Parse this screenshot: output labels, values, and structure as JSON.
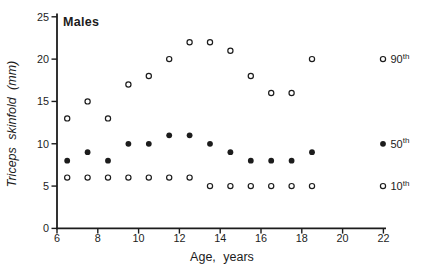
{
  "title": "Males",
  "colors": {
    "ink": "#1c1c1c",
    "background": "#ffffff"
  },
  "axes": {
    "x": {
      "label": "Age, years",
      "ticks": [
        6,
        8,
        10,
        12,
        14,
        16,
        18,
        20,
        22
      ]
    },
    "y": {
      "label": "Triceps skinfold (mm)",
      "ticks": [
        0,
        5,
        10,
        15,
        20,
        25
      ]
    }
  },
  "legend": [
    {
      "base": "90",
      "sup": "th",
      "marker": "open-circle",
      "at_value": 20
    },
    {
      "base": "50",
      "sup": "th",
      "marker": "filled-circle",
      "at_value": 10
    },
    {
      "base": "10",
      "sup": "th",
      "marker": "open-circle",
      "at_value": 5
    }
  ],
  "chart_data": {
    "type": "scatter",
    "title": "Males",
    "xlabel": "Age, years",
    "ylabel": "Triceps skinfold (mm)",
    "xlim": [
      6,
      22
    ],
    "ylim": [
      0,
      25
    ],
    "grid": false,
    "legend_position": "right",
    "x": [
      6.5,
      7.5,
      8.5,
      9.5,
      10.5,
      11.5,
      12.5,
      13.5,
      14.5,
      15.5,
      16.5,
      17.5,
      18.5
    ],
    "series": [
      {
        "name": "90th",
        "marker": "open-circle",
        "values": [
          13,
          15,
          13,
          17,
          18,
          20,
          22,
          22,
          21,
          18,
          16,
          16,
          20
        ]
      },
      {
        "name": "50th",
        "marker": "filled-circle",
        "values": [
          8,
          9,
          8,
          10,
          10,
          11,
          11,
          10,
          9,
          8,
          8,
          8,
          9
        ]
      },
      {
        "name": "10th",
        "marker": "open-circle",
        "values": [
          6,
          6,
          6,
          6,
          6,
          6,
          6,
          5,
          5,
          5,
          5,
          5,
          5
        ]
      }
    ]
  }
}
